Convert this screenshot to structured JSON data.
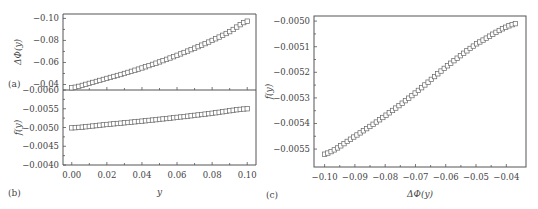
{
  "chart_data": [
    {
      "id": "a",
      "type": "scatter",
      "panel_label": "(a)",
      "title": "",
      "xlabel": "",
      "ylabel": "ΔΦ(y)",
      "xlim": [
        -0.005,
        0.105
      ],
      "ylim": [
        -0.035,
        -0.104
      ],
      "y_inverted": true,
      "yticks": [
        -0.04,
        -0.06,
        -0.08,
        -0.1
      ],
      "ytick_labels": [
        "−0.04",
        "−0.06",
        "−0.08",
        "−0.10"
      ],
      "xticks": [
        0.0,
        0.02,
        0.04,
        0.06,
        0.08,
        0.1
      ],
      "series": [
        {
          "name": "ΔΦ(y)",
          "marker": "open-square",
          "x_start": 0.0,
          "x_end": 0.1,
          "n_points": 51,
          "points": [
            [
              0.0,
              -0.037
            ],
            [
              0.01,
              -0.041
            ],
            [
              0.02,
              -0.0455
            ],
            [
              0.03,
              -0.05
            ],
            [
              0.04,
              -0.055
            ],
            [
              0.05,
              -0.0605
            ],
            [
              0.06,
              -0.0665
            ],
            [
              0.07,
              -0.073
            ],
            [
              0.08,
              -0.08
            ],
            [
              0.09,
              -0.088
            ],
            [
              0.1,
              -0.0975
            ]
          ]
        }
      ]
    },
    {
      "id": "b",
      "type": "scatter",
      "panel_label": "(b)",
      "title": "",
      "xlabel": "y",
      "ylabel": "f(y)",
      "xlim": [
        -0.005,
        0.105
      ],
      "ylim": [
        -0.004,
        -0.006
      ],
      "y_inverted": true,
      "yticks": [
        -0.004,
        -0.0045,
        -0.005,
        -0.0055,
        -0.006
      ],
      "ytick_labels": [
        "−0.0040",
        "−0.0045",
        "−0.0050",
        "−0.0055",
        "−0.0060"
      ],
      "xticks": [
        0.0,
        0.02,
        0.04,
        0.06,
        0.08,
        0.1
      ],
      "xtick_labels": [
        "0.00",
        "0.02",
        "0.04",
        "0.06",
        "0.08",
        "0.10"
      ],
      "series": [
        {
          "name": "f(y)",
          "marker": "open-square",
          "x_start": 0.0,
          "x_end": 0.1,
          "n_points": 51,
          "points": [
            [
              0.0,
              -0.00499
            ],
            [
              0.02,
              -0.00508
            ],
            [
              0.04,
              -0.00517
            ],
            [
              0.06,
              -0.00527
            ],
            [
              0.08,
              -0.00538
            ],
            [
              0.1,
              -0.0055
            ]
          ]
        }
      ]
    },
    {
      "id": "c",
      "type": "scatter",
      "panel_label": "(c)",
      "title": "",
      "xlabel": "ΔΦ(y)",
      "ylabel": "f(y)",
      "xlim": [
        -0.1035,
        -0.0335
      ],
      "ylim": [
        -0.00557,
        -0.00498
      ],
      "yticks": [
        -0.0055,
        -0.0054,
        -0.0053,
        -0.0052,
        -0.0051,
        -0.005
      ],
      "ytick_labels": [
        "−0.0055",
        "−0.0054",
        "−0.0053",
        "−0.0052",
        "−0.0051",
        "−0.0050"
      ],
      "xticks": [
        -0.1,
        -0.09,
        -0.08,
        -0.07,
        -0.06,
        -0.05,
        -0.04
      ],
      "xtick_labels": [
        "−0.10",
        "−0.09",
        "−0.08",
        "−0.07",
        "−0.06",
        "−0.05",
        "−0.04"
      ],
      "series": [
        {
          "name": "f vs ΔΦ",
          "marker": "open-square",
          "n_points": 60,
          "points": [
            [
              -0.1,
              -0.00552
            ],
            [
              -0.09,
              -0.00545
            ],
            [
              -0.08,
              -0.00537
            ],
            [
              -0.07,
              -0.00528
            ],
            [
              -0.06,
              -0.00518
            ],
            [
              -0.05,
              -0.00509
            ],
            [
              -0.037,
              -0.00501
            ]
          ]
        }
      ]
    }
  ]
}
